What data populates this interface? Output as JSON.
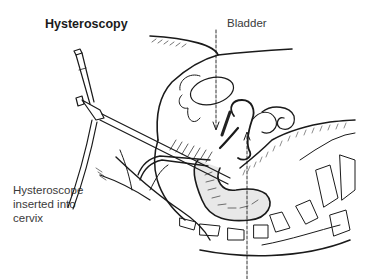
{
  "diagram": {
    "title": "Hysteroscopy",
    "labels": {
      "bladder": "Bladder",
      "hysteroscope": "Hysteroscope inserted into cervix"
    },
    "colors": {
      "line": "#1a1a1a",
      "text": "#3a3a3a",
      "background": "#ffffff"
    }
  }
}
